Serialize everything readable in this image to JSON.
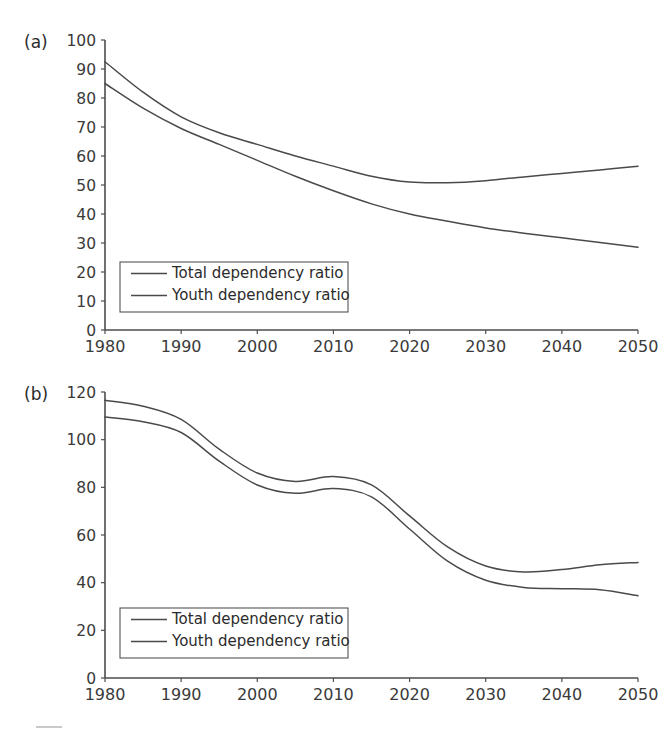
{
  "figure": {
    "background_color": "#ffffff",
    "line_color": "#4a4a4a",
    "axis_color": "#4d4d4d",
    "text_color": "#2b2b2b"
  },
  "panels": [
    {
      "tag": "(a)",
      "legend": {
        "entries": [
          "Total dependency ratio",
          "Youth dependency ratio"
        ]
      }
    },
    {
      "tag": "(b)",
      "legend": {
        "entries": [
          "Total dependency ratio",
          "Youth dependency ratio"
        ]
      }
    }
  ],
  "chart_data": [
    {
      "type": "line",
      "title": "(a)",
      "xlabel": "",
      "ylabel": "",
      "xlim": [
        1980,
        2050
      ],
      "ylim": [
        0,
        100
      ],
      "grid": false,
      "legend_position": "lower-left",
      "xticks": [
        1980,
        1990,
        2000,
        2010,
        2020,
        2030,
        2040,
        2050
      ],
      "yticks": [
        0,
        10,
        20,
        30,
        40,
        50,
        60,
        70,
        80,
        90,
        100
      ],
      "x": [
        1980,
        1985,
        1990,
        1995,
        2000,
        2005,
        2010,
        2015,
        2020,
        2025,
        2030,
        2035,
        2040,
        2045,
        2050
      ],
      "series": [
        {
          "name": "Total dependency ratio",
          "values": [
            92.5,
            82.0,
            73.5,
            68.0,
            64.0,
            60.0,
            56.5,
            53.0,
            51.0,
            50.8,
            51.5,
            52.8,
            54.0,
            55.2,
            56.5
          ]
        },
        {
          "name": "Youth dependency ratio",
          "values": [
            85.0,
            76.5,
            69.5,
            64.0,
            58.5,
            53.0,
            48.0,
            43.5,
            40.0,
            37.5,
            35.2,
            33.4,
            31.8,
            30.2,
            28.5
          ]
        }
      ]
    },
    {
      "type": "line",
      "title": "(b)",
      "xlabel": "",
      "ylabel": "",
      "xlim": [
        1980,
        2050
      ],
      "ylim": [
        0,
        120
      ],
      "grid": false,
      "legend_position": "lower-left",
      "xticks": [
        1980,
        1990,
        2000,
        2010,
        2020,
        2030,
        2040,
        2050
      ],
      "yticks": [
        0,
        20,
        40,
        60,
        80,
        100,
        120
      ],
      "x": [
        1980,
        1985,
        1990,
        1995,
        2000,
        2005,
        2010,
        2015,
        2020,
        2025,
        2030,
        2035,
        2040,
        2045,
        2050
      ],
      "series": [
        {
          "name": "Total dependency ratio",
          "values": [
            116.5,
            114.0,
            108.5,
            96.0,
            86.0,
            82.5,
            84.5,
            81.0,
            68.0,
            55.0,
            47.0,
            44.5,
            45.5,
            47.5,
            48.5
          ]
        },
        {
          "name": "Youth dependency ratio",
          "values": [
            109.5,
            107.5,
            103.0,
            91.0,
            81.0,
            77.5,
            79.5,
            76.0,
            62.5,
            49.0,
            41.0,
            38.0,
            37.5,
            37.0,
            34.5
          ]
        }
      ]
    }
  ]
}
